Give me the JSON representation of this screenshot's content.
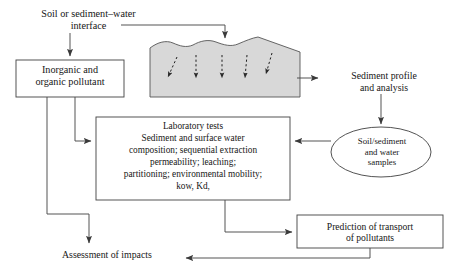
{
  "diagram": {
    "title_alt": "Soil/sediment-water pollutant assessment flow diagram",
    "colors": {
      "stroke": "#4a4a4a",
      "text": "#161616",
      "sediment_fill": "#d8d8d8",
      "sediment_stroke": "#555555",
      "background": "#ffffff"
    },
    "nodes": {
      "interface": {
        "label": "Soil or sediment–water\ninterface",
        "shape": "plain-text"
      },
      "inorganic_pollutant": {
        "label": "Inorganic and\norganic pollutant",
        "shape": "rectangle"
      },
      "laboratory_tests": {
        "label": "Laboratory tests\nSediment and surface water\ncomposition; sequential extraction\npermeability; leaching;\npartitioning; environmental mobility;\nkow, Kd,",
        "shape": "rectangle"
      },
      "sediment_profile": {
        "label": "Sediment profile\nand analysis",
        "shape": "plain-text"
      },
      "samples": {
        "label": "Soil/sediment\nand water\nsamples",
        "shape": "ellipse"
      },
      "prediction": {
        "label": "Prediction of transport\nof  pollutants",
        "shape": "rectangle"
      },
      "assessment": {
        "label": "Assessment of impacts",
        "shape": "plain-text"
      },
      "sediment_graphic": {
        "label": "sediment-cross-section",
        "shape": "wavy-polygon",
        "infiltration_arrows": 5
      }
    },
    "edges": [
      {
        "from": "interface",
        "to": "sediment_graphic",
        "style": "solid-arrow"
      },
      {
        "from": "interface",
        "to": "inorganic_pollutant",
        "style": "solid-arrow"
      },
      {
        "from": "sediment_graphic",
        "to": "sediment_profile",
        "style": "solid-arrow"
      },
      {
        "from": "sediment_profile",
        "to": "samples",
        "style": "solid-arrow"
      },
      {
        "from": "samples",
        "to": "laboratory_tests",
        "style": "solid-arrow"
      },
      {
        "from": "inorganic_pollutant",
        "to": "laboratory_tests",
        "style": "solid-arrow"
      },
      {
        "from": "inorganic_pollutant",
        "to": "assessment",
        "style": "solid-arrow"
      },
      {
        "from": "laboratory_tests",
        "to": "prediction",
        "style": "solid-arrow"
      },
      {
        "from": "prediction",
        "to": "assessment",
        "style": "solid-arrow"
      }
    ]
  }
}
